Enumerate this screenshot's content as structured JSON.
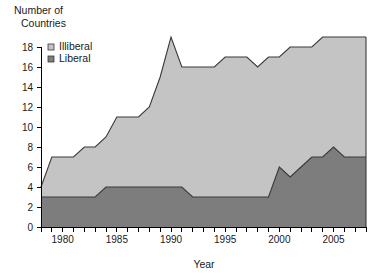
{
  "chart_data": {
    "type": "area",
    "stacked": true,
    "title": "",
    "ylabel": "Number of Countries",
    "xlabel": "Year",
    "ylim": [
      0,
      19.5
    ],
    "xlim": [
      1978,
      2008
    ],
    "yticks": [
      0,
      2,
      4,
      6,
      8,
      10,
      12,
      14,
      16,
      18
    ],
    "ytick_labels": [
      "0",
      "2",
      "4",
      "6",
      "8",
      "10",
      "12",
      "14",
      "16",
      "18"
    ],
    "xticks": [
      1978,
      1979,
      1980,
      1981,
      1982,
      1983,
      1984,
      1985,
      1986,
      1987,
      1988,
      1989,
      1990,
      1991,
      1992,
      1993,
      1994,
      1995,
      1996,
      1997,
      1998,
      1999,
      2000,
      2001,
      2002,
      2003,
      2004,
      2005,
      2006,
      2007,
      2008
    ],
    "xtick_labels": [
      "1980",
      "1985",
      "1990",
      "1995",
      "2000",
      "2005"
    ],
    "xtick_labeled_years": [
      1980,
      1985,
      1990,
      1995,
      2000,
      2005
    ],
    "grid": false,
    "legend_position": "top-left",
    "x": [
      1978,
      1979,
      1980,
      1981,
      1982,
      1983,
      1984,
      1985,
      1986,
      1987,
      1988,
      1989,
      1990,
      1991,
      1992,
      1993,
      1994,
      1995,
      1996,
      1997,
      1998,
      1999,
      2000,
      2001,
      2002,
      2003,
      2004,
      2005,
      2006,
      2007,
      2008
    ],
    "series": [
      {
        "name": "Liberal",
        "color": "#7d7d7d",
        "values": [
          3,
          3,
          3,
          3,
          3,
          3,
          4,
          4,
          4,
          4,
          4,
          4,
          4,
          4,
          3,
          3,
          3,
          3,
          3,
          3,
          3,
          3,
          6,
          5,
          6,
          7,
          7,
          8,
          7,
          7,
          7
        ]
      },
      {
        "name": "Illiberal",
        "color": "#c4c4c4",
        "values": [
          1,
          4,
          4,
          4,
          5,
          5,
          5,
          7,
          7,
          7,
          8,
          11,
          15,
          12,
          13,
          13,
          13,
          14,
          14,
          14,
          13,
          14,
          11,
          13,
          12,
          11,
          12,
          11,
          12,
          12,
          12
        ]
      }
    ],
    "totals": [
      4,
      7,
      7,
      7,
      8,
      8,
      9,
      11,
      11,
      11,
      12,
      15,
      19,
      16,
      16,
      16,
      16,
      17,
      17,
      17,
      16,
      17,
      17,
      18,
      18,
      18,
      19,
      19,
      19,
      19,
      19
    ]
  },
  "legend": {
    "items": [
      {
        "label": "Illiberal",
        "swatch": "light"
      },
      {
        "label": "Liberal",
        "swatch": "dark"
      }
    ]
  },
  "axis": {
    "y_title_line1": "Number of",
    "y_title_line2": "Countries",
    "x_title": "Year"
  },
  "colors": {
    "liberal": "#7d7d7d",
    "illiberal": "#c4c4c4",
    "outline": "#3a3a3a",
    "axis": "#000000",
    "text": "#1a1a1a",
    "background": "#ffffff"
  }
}
